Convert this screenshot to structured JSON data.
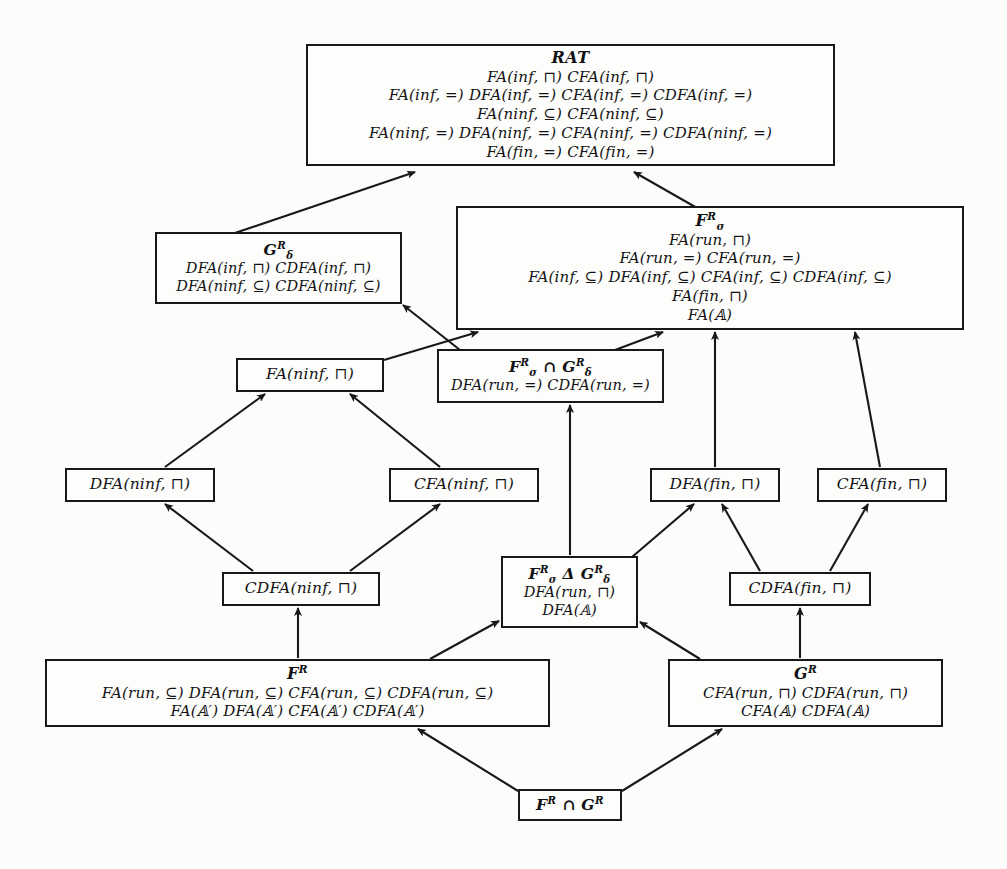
{
  "diagram": {
    "background_color": "#fcfcfa",
    "line_color": "#18181a",
    "nodes": [
      {
        "id": "rat",
        "title": "RAT",
        "rows": [
          "FA(inf, ⊓)  CFA(inf, ⊓)",
          "FA(inf, =)  DFA(inf, =)  CFA(inf, =)  CDFA(inf, =)",
          "FA(ninf, ⊆)  CFA(ninf, ⊆)",
          "FA(ninf, =)  DFA(ninf, =)  CFA(ninf, =)  CDFA(ninf, =)",
          "FA(fin, =)  CFA(fin, =)"
        ],
        "x": 306,
        "y": 44,
        "w": 529,
        "h": 122,
        "size": "big"
      },
      {
        "id": "g-delta-r",
        "title": "G Rδ",
        "title_html": "G<sup>R</sup><sub>δ</sub>",
        "rows": [
          "DFA(inf, ⊓)  CDFA(inf, ⊓)",
          "DFA(ninf, ⊆)  CDFA(ninf, ⊆)"
        ],
        "x": 155,
        "y": 232,
        "w": 247,
        "h": 72,
        "size": "mid"
      },
      {
        "id": "f-sigma-r",
        "title": "F Rσ",
        "title_html": "F<sup>R</sup><sub>σ</sub>",
        "rows": [
          "FA(run, ⊓)",
          "FA(run, =)  CFA(run, =)",
          "FA(inf, ⊆)  DFA(inf, ⊆)  CFA(inf, ⊆)  CDFA(inf, ⊆)",
          "FA(fin, ⊓)",
          "FA(𝔸)"
        ],
        "x": 456,
        "y": 206,
        "w": 508,
        "h": 124,
        "size": "big"
      },
      {
        "id": "fa-ninf-meet",
        "title": "",
        "rows": [
          "FA(ninf, ⊓)"
        ],
        "x": 236,
        "y": 358,
        "w": 148,
        "h": 34,
        "size": "leaf"
      },
      {
        "id": "f-cap-g",
        "title": "F Rσ ∩ G Rδ",
        "title_html": "F<sup>R</sup><sub>σ</sub> ∩ G<sup>R</sup><sub>δ</sub>",
        "rows": [
          "DFA(run, =)  CDFA(run, =)"
        ],
        "x": 437,
        "y": 349,
        "w": 227,
        "h": 54,
        "size": "mid"
      },
      {
        "id": "dfa-ninf-meet",
        "title": "",
        "rows": [
          "DFA(ninf, ⊓)"
        ],
        "x": 65,
        "y": 468,
        "w": 150,
        "h": 34,
        "size": "leaf"
      },
      {
        "id": "cfa-ninf-meet",
        "title": "",
        "rows": [
          "CFA(ninf, ⊓)"
        ],
        "x": 389,
        "y": 468,
        "w": 150,
        "h": 34,
        "size": "leaf"
      },
      {
        "id": "dfa-fin-meet",
        "title": "",
        "rows": [
          "DFA(fin, ⊓)"
        ],
        "x": 650,
        "y": 468,
        "w": 130,
        "h": 34,
        "size": "leaf"
      },
      {
        "id": "cfa-fin-meet",
        "title": "",
        "rows": [
          "CFA(fin, ⊓)"
        ],
        "x": 817,
        "y": 468,
        "w": 130,
        "h": 34,
        "size": "leaf"
      },
      {
        "id": "cdfa-ninf-meet",
        "title": "",
        "rows": [
          "CDFA(ninf, ⊓)"
        ],
        "x": 222,
        "y": 572,
        "w": 158,
        "h": 34,
        "size": "leaf"
      },
      {
        "id": "f-delta-g",
        "title": "F Rσ Δ G Rδ",
        "title_html": "F<sup>R</sup><sub>σ</sub> Δ G<sup>R</sup><sub>δ</sub>",
        "rows": [
          "DFA(run, ⊓)",
          "DFA(𝔸)"
        ],
        "x": 501,
        "y": 556,
        "w": 137,
        "h": 72,
        "size": "mid"
      },
      {
        "id": "cdfa-fin-meet",
        "title": "",
        "rows": [
          "CDFA(fin, ⊓)"
        ],
        "x": 729,
        "y": 572,
        "w": 142,
        "h": 34,
        "size": "leaf"
      },
      {
        "id": "f-r",
        "title": "F R",
        "title_html": "F<sup>R</sup>",
        "rows": [
          "FA(run, ⊆)  DFA(run, ⊆)  CFA(run, ⊆)  CDFA(run, ⊆)",
          "FA(𝔸′)  DFA(𝔸′)  CFA(𝔸′)  CDFA(𝔸′)"
        ],
        "x": 45,
        "y": 659,
        "w": 505,
        "h": 68,
        "size": "big"
      },
      {
        "id": "g-r",
        "title": "G R",
        "title_html": "G<sup>R</sup>",
        "rows": [
          "CFA(run, ⊓)  CDFA(run, ⊓)",
          "CFA(𝔸)  CDFA(𝔸)"
        ],
        "x": 668,
        "y": 659,
        "w": 275,
        "h": 68,
        "size": "big"
      },
      {
        "id": "f-cap-g-bottom",
        "title": "F R ∩ G R",
        "title_html": "F<sup>R</sup> ∩ G<sup>R</sup>",
        "rows": [],
        "x": 518,
        "y": 789,
        "w": 104,
        "h": 32,
        "size": "mid"
      }
    ],
    "edges": [
      {
        "from": "g-delta-r",
        "to": "rat",
        "path": "M 232,234 L 415,172",
        "label": "g-delta-to-rat"
      },
      {
        "from": "f-sigma-r",
        "to": "rat",
        "path": "M 697,208 L 634,172",
        "label": "f-sigma-to-rat"
      },
      {
        "from": "f-cap-g",
        "to": "g-delta-r",
        "path": "M 460,350 L 403,305",
        "label": "fcapg-to-gdelta"
      },
      {
        "from": "fa-ninf-meet",
        "to": "f-sigma-r",
        "path": "M 384,360 L 478,332",
        "label": "faninf-to-fsigma"
      },
      {
        "from": "f-cap-g",
        "to": "f-sigma-r",
        "path": "M 615,350 L 663,332",
        "label": "fcapg-to-fsigma"
      },
      {
        "from": "dfa-ninf-meet",
        "to": "fa-ninf-meet",
        "path": "M 165,467 L 265,394",
        "label": "dfaninf-to-faninf"
      },
      {
        "from": "cfa-ninf-meet",
        "to": "fa-ninf-meet",
        "path": "M 440,467 L 350,394",
        "label": "cfaninf-to-faninf"
      },
      {
        "from": "cdfa-ninf-meet",
        "to": "dfa-ninf-meet",
        "path": "M 253,571 L 165,504",
        "label": "cdfaninf-to-dfaninf"
      },
      {
        "from": "cdfa-ninf-meet",
        "to": "cfa-ninf-meet",
        "path": "M 350,571 L 440,504",
        "label": "cdfaninf-to-cfaninf"
      },
      {
        "from": "f-r",
        "to": "cdfa-ninf-meet",
        "path": "M 298,658 L 298,608",
        "label": "fr-to-cdfaninf"
      },
      {
        "from": "f-r",
        "to": "f-delta-g",
        "path": "M 430,659 L 499,621",
        "label": "fr-to-fdeltag"
      },
      {
        "from": "f-delta-g",
        "to": "f-cap-g",
        "path": "M 570,555 L 570,405",
        "label": "fdeltag-to-fcapg"
      },
      {
        "from": "f-delta-g",
        "to": "dfa-fin-meet",
        "path": "M 632,557 L 694,504",
        "label": "fdeltag-to-dfafin"
      },
      {
        "from": "cdfa-fin-meet",
        "to": "dfa-fin-meet",
        "path": "M 760,571 L 722,504",
        "label": "cdfafin-to-dfafin"
      },
      {
        "from": "cdfa-fin-meet",
        "to": "cfa-fin-meet",
        "path": "M 830,571 L 868,504",
        "label": "cdfafin-to-cfafin"
      },
      {
        "from": "g-r",
        "to": "cdfa-fin-meet",
        "path": "M 800,658 L 800,608",
        "label": "gr-to-cdfafin"
      },
      {
        "from": "g-r",
        "to": "f-delta-g",
        "path": "M 700,659 L 640,622",
        "label": "gr-to-fdeltag"
      },
      {
        "from": "dfa-fin-meet",
        "to": "f-sigma-r",
        "path": "M 715,467 L 715,332",
        "label": "dfafin-to-fsigma"
      },
      {
        "from": "cfa-fin-meet",
        "to": "f-sigma-r",
        "path": "M 880,467 L 855,332",
        "label": "cfafin-to-fsigma"
      },
      {
        "from": "f-cap-g-bottom",
        "to": "f-r",
        "path": "M 518,791 L 418,729",
        "label": "fcapgbottom-to-fr"
      },
      {
        "from": "f-cap-g-bottom",
        "to": "g-r",
        "path": "M 622,791 L 722,729",
        "label": "fcapgbottom-to-gr"
      }
    ]
  }
}
